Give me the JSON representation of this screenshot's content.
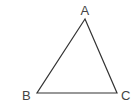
{
  "diagram": {
    "type": "triangle",
    "vertices": [
      {
        "label": "A",
        "x": 85,
        "y": 19
      },
      {
        "label": "B",
        "x": 37,
        "y": 93
      },
      {
        "label": "C",
        "x": 117,
        "y": 93
      }
    ],
    "labels": {
      "a": "A",
      "b": "B",
      "c": "C"
    },
    "stroke_color": "#333333",
    "label_color": "#444444"
  }
}
